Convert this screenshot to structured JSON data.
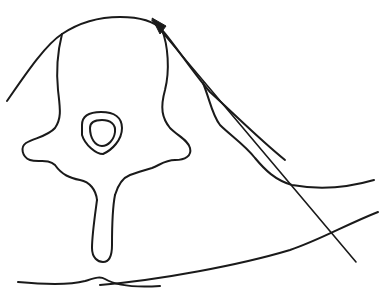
{
  "diagram": {
    "type": "anatomical line drawing",
    "colors": {
      "stroke": "#1a1a1a",
      "background": "#ffffff"
    },
    "elements": [
      {
        "id": "skin-outline-upper",
        "label": "upper body contour arc"
      },
      {
        "id": "vertebral-body",
        "label": "vertebral body outline"
      },
      {
        "id": "spinal-canal-outer",
        "label": "spinal canal outer ring"
      },
      {
        "id": "spinal-canal-inner",
        "label": "spinal canal inner ring"
      },
      {
        "id": "transverse-process-left",
        "label": "left transverse process"
      },
      {
        "id": "transverse-process-right",
        "label": "right transverse process"
      },
      {
        "id": "spinous-process",
        "label": "spinous process"
      },
      {
        "id": "psoas-muscle-contour",
        "label": "lateral muscle contour"
      },
      {
        "id": "back-skin-line",
        "label": "posterior skin line"
      },
      {
        "id": "lateral-body-contour",
        "label": "lateral body contour"
      },
      {
        "id": "trajectory-arrow",
        "label": "needle trajectory arrow"
      }
    ]
  }
}
